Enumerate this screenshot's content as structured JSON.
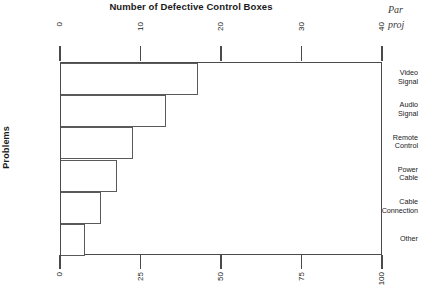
{
  "chart_data": {
    "type": "bar",
    "title": "Number of Defective Control Boxes",
    "orientation": "horizontal",
    "categories": [
      "Video Signal",
      "Audio Signal",
      "Remote Control",
      "Power Cable",
      "Cable Connection",
      "Other"
    ],
    "values": [
      17,
      13,
      9,
      7,
      5,
      3
    ],
    "xlabel": "Number of Defective Control Boxes",
    "ylabel": "Problems",
    "xlim": [
      0,
      40
    ],
    "grid": false,
    "legend": false,
    "top_axis": {
      "label": "Number of Defective Control Boxes",
      "ticks": [
        0,
        10,
        20,
        30,
        40
      ],
      "tick_labels": [
        "0",
        "10",
        "20",
        "30",
        "40"
      ],
      "min": 0,
      "max": 40
    },
    "bottom_axis": {
      "label": "",
      "ticks": [
        0,
        25,
        50,
        75,
        100
      ],
      "tick_labels": [
        "0",
        "25",
        "50",
        "75",
        "100"
      ],
      "min": 0,
      "max": 100
    }
  },
  "title": "Number of Defective Control Boxes",
  "y_axis_title": "Problems",
  "categories": [
    {
      "line1": "Video",
      "line2": "Signal",
      "value": 17
    },
    {
      "line1": "Audio",
      "line2": "Signal",
      "value": 13
    },
    {
      "line1": "Remote",
      "line2": "Control",
      "value": 9
    },
    {
      "line1": "Power",
      "line2": "Cable",
      "value": 7
    },
    {
      "line1": "Cable",
      "line2": "Connection",
      "value": 5
    },
    {
      "line1": "Other",
      "line2": "",
      "value": 3
    }
  ],
  "top_ticks": [
    {
      "label": "0",
      "value": 0
    },
    {
      "label": "10",
      "value": 10
    },
    {
      "label": "20",
      "value": 20
    },
    {
      "label": "30",
      "value": 30
    },
    {
      "label": "40",
      "value": 40
    }
  ],
  "bottom_ticks": [
    {
      "label": "0",
      "value": 0
    },
    {
      "label": "25",
      "value": 25
    },
    {
      "label": "50",
      "value": 50
    },
    {
      "label": "75",
      "value": 75
    },
    {
      "label": "100",
      "value": 100
    }
  ],
  "margin_note": {
    "line1": "Par",
    "line2": "proj"
  },
  "colors": {
    "axis": "#4a4a4a",
    "bar_stroke": "#5a5a5a",
    "bar_fill": "#ffffff",
    "text": "#1a1a1a"
  }
}
